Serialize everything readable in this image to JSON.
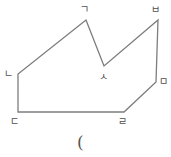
{
  "figure": {
    "stroke_color": "#7d7d7d",
    "stroke_width": 1.3,
    "background_color": "#ffffff",
    "label_color": "#4d4d4d",
    "caption_color": "#555555",
    "shape_type": "concave-polygon",
    "vertex_count": 7,
    "path": "M 86,20 L 104,66 L 158,20 L 156,82 L 124,112 L 18,112 L 18,74 Z",
    "vertices": [
      {
        "id": "giyeok",
        "label": "ㄱ",
        "x": 86,
        "y": 20,
        "label_x": 80,
        "label_y": 5
      },
      {
        "id": "siot",
        "label": "ㅅ",
        "x": 104,
        "y": 66,
        "label_x": 99,
        "label_y": 72
      },
      {
        "id": "bieup",
        "label": "ㅂ",
        "x": 158,
        "y": 20,
        "label_x": 151,
        "label_y": 5
      },
      {
        "id": "mieum",
        "label": "ㅁ",
        "x": 156,
        "y": 82,
        "label_x": 159,
        "label_y": 77
      },
      {
        "id": "rieul",
        "label": "ㄹ",
        "x": 124,
        "y": 112,
        "label_x": 118,
        "label_y": 117
      },
      {
        "id": "digeut",
        "label": "ㄷ",
        "x": 18,
        "y": 112,
        "label_x": 10,
        "label_y": 117
      },
      {
        "id": "nieun",
        "label": "ㄴ",
        "x": 18,
        "y": 74,
        "label_x": 4,
        "label_y": 69
      }
    ],
    "edges": [
      {
        "from": "giyeok",
        "to": "siot"
      },
      {
        "from": "siot",
        "to": "bieup"
      },
      {
        "from": "bieup",
        "to": "mieum"
      },
      {
        "from": "mieum",
        "to": "rieul"
      },
      {
        "from": "rieul",
        "to": "digeut"
      },
      {
        "from": "digeut",
        "to": "nieun"
      },
      {
        "from": "nieun",
        "to": "giyeok"
      }
    ],
    "caption": {
      "text": "(",
      "x": 77,
      "y": 134
    }
  }
}
